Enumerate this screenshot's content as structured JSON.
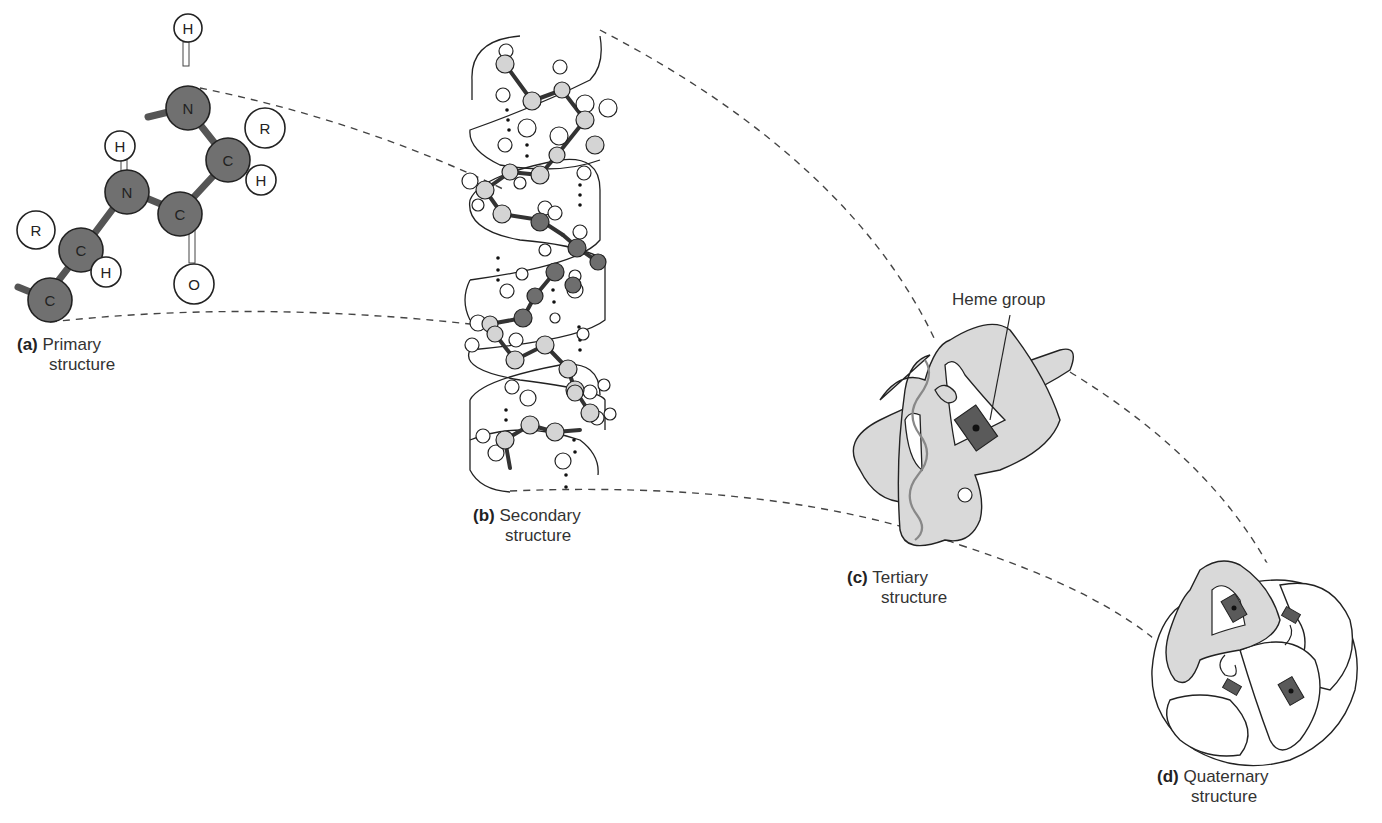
{
  "panels": [
    {
      "id": "a",
      "letter": "(a)",
      "line1": "Primary",
      "line2": "structure"
    },
    {
      "id": "b",
      "letter": "(b)",
      "line1": "Secondary",
      "line2": "structure"
    },
    {
      "id": "c",
      "letter": "(c)",
      "line1": "Tertiary",
      "line2": "structure"
    },
    {
      "id": "d",
      "letter": "(d)",
      "line1": "Quaternary",
      "line2": "structure"
    }
  ],
  "annotations": {
    "heme_label": "Heme group"
  },
  "primary_atoms": [
    {
      "symbol": "H",
      "type": "small"
    },
    {
      "symbol": "N",
      "type": "backbone"
    },
    {
      "symbol": "R",
      "type": "small"
    },
    {
      "symbol": "C",
      "type": "backbone"
    },
    {
      "symbol": "H",
      "type": "small"
    },
    {
      "symbol": "H",
      "type": "small"
    },
    {
      "symbol": "N",
      "type": "backbone"
    },
    {
      "symbol": "C",
      "type": "backbone"
    },
    {
      "symbol": "R",
      "type": "small"
    },
    {
      "symbol": "C",
      "type": "backbone"
    },
    {
      "symbol": "H",
      "type": "small"
    },
    {
      "symbol": "O",
      "type": "small"
    },
    {
      "symbol": "C",
      "type": "backbone"
    }
  ],
  "colors": {
    "backbone_atom": "#707070",
    "helix_atom": "#d4d4d4",
    "helix_dark_atom": "#6e6e6e",
    "ribbon_fill": "#d9d9d9",
    "ribbon_stroke": "#222222",
    "heme_fill": "#5a5a5a",
    "dash_color": "#444444"
  }
}
